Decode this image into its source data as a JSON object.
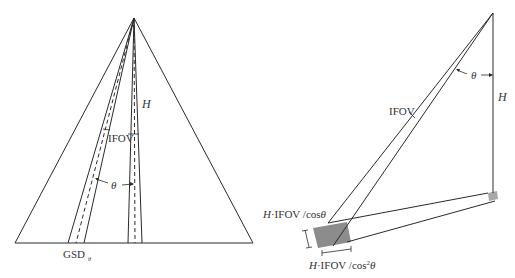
{
  "left_diagram": {
    "labels": {
      "height": "H",
      "ifov": "IFOV",
      "angle": "θ",
      "gsd_main": "GSD",
      "gsd_sub": "θ"
    }
  },
  "right_diagram": {
    "labels": {
      "angle": "θ",
      "height": "H",
      "ifov": "IFOV",
      "cross_track": "H·IFOV /cosθ",
      "along_track_prefix": "H·IFOV /cos",
      "along_track_sup": "2",
      "along_track_suffix": "θ"
    }
  },
  "colors": {
    "line": "#2a2a2a",
    "shade": "#8c8c8c",
    "shade_light": "#a8a8a8",
    "text": "#333333"
  }
}
